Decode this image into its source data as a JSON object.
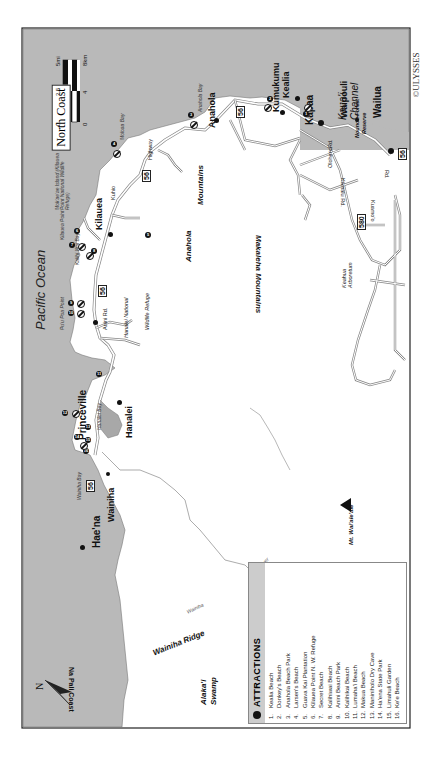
{
  "map": {
    "title": "North Coast",
    "publisher": "©ULYSSES",
    "scale": {
      "miles_labels": [
        "0",
        "2.5",
        "5mi"
      ],
      "km_labels": [
        "0",
        "4",
        "8km"
      ]
    },
    "compass": "N",
    "colors": {
      "ocean": "#b9b9b9",
      "land": "#ffffff",
      "road": "#8a8a8a",
      "frame": "#222222"
    },
    "water_labels": {
      "pacific": "Pacific Ocean",
      "channel": "Kaua'i Channel",
      "na_pali": "Na Pali Coast",
      "anahola_bay": "Anahola Bay",
      "moloaa_bay": "Moloaa Bay",
      "kalihi_wai_bay": "Kalihi Wai Bay",
      "hanalei_bay": "Hanalei Bay",
      "wainiha_bay": "Wainiha Bay",
      "puupoa_point": "Pu'u Poa Point",
      "kilauea_point": "Kilauea Point",
      "moku_aeae": "Mok'ae'ae Island (Kilauea Point National Wildlife Refuge)"
    },
    "towns": {
      "kilauea": "Kilauea",
      "anahola": "Anahola",
      "kumukumu": "Kumukumu",
      "kealia": "Kealia",
      "kapaa": "Kapaa",
      "waipouli": "Waipouli",
      "wailua": "Wailua",
      "princeville": "Princeville",
      "hanalei": "Hanalei",
      "wainiha": "Wainiha",
      "haena": "Hae'na"
    },
    "regions": {
      "anahola_mtns_1": "Anahola",
      "anahola_mtns_2": "Mountains",
      "makaleha": "Makaleha Mountains",
      "mt_waialeale": "Mt. Wai'ale'ale",
      "keahua": "Keahua Arboretum",
      "wainiha_ridge": "Wainiha Ridge",
      "alakai_1": "Alaka'i",
      "alakai_2": "Swamp",
      "hanalei_refuge_1": "Hanalei National",
      "hanalei_refuge_2": "Wildlife Refuge",
      "nounou_1": "Nounou Forest",
      "nounou_2": "Reserve",
      "wainiha_river_1": "Wainiha",
      "wainiha_river_2": "River"
    },
    "roads": {
      "hwy56": "56",
      "hwy580": "580",
      "kuhio": "Kuhio",
      "highway": "Highway",
      "anini": "Anini Rd.",
      "olohena": "Olohena",
      "rd": "Rd.",
      "kamalu": "Kamalu Rd.",
      "kuamoo": "Kuamo'o",
      "kuamoo_rd": "Rd."
    }
  },
  "legend": {
    "title": "ATTRACTIONS",
    "items": [
      {
        "n": "1.",
        "name": "Kealia Beach"
      },
      {
        "n": "2.",
        "name": "Donkey's Beach"
      },
      {
        "n": "3.",
        "name": "Anahola Beach Park"
      },
      {
        "n": "4.",
        "name": "Larsen's Beach"
      },
      {
        "n": "5.",
        "name": "Guava Kai Plantation"
      },
      {
        "n": "6.",
        "name": "Kilauea Point N. W. Refuge"
      },
      {
        "n": "7.",
        "name": "Secret Beach"
      },
      {
        "n": "8.",
        "name": "Kalihiwai Beach"
      },
      {
        "n": "9.",
        "name": "Anini Beach Park"
      },
      {
        "n": "10.",
        "name": "Kalihikai Beach"
      },
      {
        "n": "11.",
        "name": "Lumaha'i Beach"
      },
      {
        "n": "12.",
        "name": "Makua Beach"
      },
      {
        "n": "13.",
        "name": "Maniniholo Dry Cave"
      },
      {
        "n": "14.",
        "name": "Ha'ena State Park"
      },
      {
        "n": "15.",
        "name": "Limahuli Garden"
      },
      {
        "n": "16.",
        "name": "Ke'e Beach"
      }
    ]
  },
  "markers": [
    {
      "num": "1",
      "x": 303,
      "y": 114
    },
    {
      "num": "2",
      "x": 263,
      "y": 96
    },
    {
      "num": "3",
      "x": 190,
      "y": 114
    },
    {
      "num": "4",
      "x": 113,
      "y": 143
    },
    {
      "num": "5",
      "x": 147,
      "y": 235
    },
    {
      "num": "6",
      "x": 75,
      "y": 230
    },
    {
      "num": "7",
      "x": 70,
      "y": 243
    },
    {
      "num": "8",
      "x": 92,
      "y": 250
    },
    {
      "num": "9",
      "x": 70,
      "y": 300
    },
    {
      "num": "10",
      "x": 70,
      "y": 310
    },
    {
      "num": "11",
      "x": 97,
      "y": 373
    },
    {
      "num": "12",
      "x": 62,
      "y": 412
    },
    {
      "num": "13",
      "x": 87,
      "y": 424
    },
    {
      "num": "14",
      "x": 75,
      "y": 434
    },
    {
      "num": "15",
      "x": 87,
      "y": 438
    },
    {
      "num": "16",
      "x": 86,
      "y": 449
    }
  ]
}
